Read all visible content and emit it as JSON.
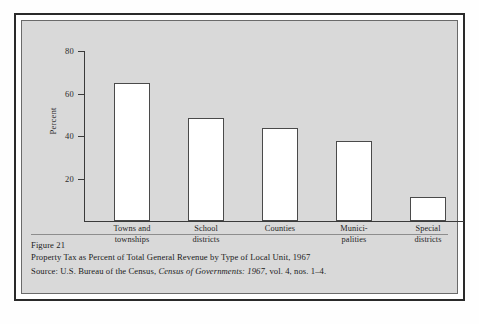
{
  "figure": {
    "number_label": "Figure 21",
    "title": "Property Tax as Percent of Total General Revenue by Type of Local Unit, 1967",
    "source_prefix": "Source:  U.S. Bureau of the Census, ",
    "source_italic": "Census of Governments:  1967",
    "source_suffix": ", vol. 4, nos. 1–4."
  },
  "chart_data": {
    "type": "bar",
    "title": "Property Tax as Percent of Total General Revenue by Type of Local Unit, 1967",
    "xlabel": "",
    "ylabel": "Percent",
    "ylim": [
      0,
      80
    ],
    "yticks": [
      20,
      40,
      60,
      80
    ],
    "ytick_labels": [
      "20",
      "40",
      "60",
      "80"
    ],
    "grid": false,
    "legend": false,
    "categories": [
      "Towns and townships",
      "School districts",
      "Counties",
      "Municipalities",
      "Special districts"
    ],
    "category_lines": [
      [
        "Towns and",
        "townships"
      ],
      [
        "School",
        "districts"
      ],
      [
        "Counties",
        ""
      ],
      [
        "Munici-",
        "palities"
      ],
      [
        "Special",
        "districts"
      ]
    ],
    "values": [
      65,
      48.5,
      44,
      37.5,
      11.5
    ],
    "bar_fill": "#ffffff",
    "bar_edge": "#4a4a4a"
  },
  "colors": {
    "panel": "#d9d9d9",
    "frame": "#2a2a2a",
    "axis": "#3a3a3a",
    "text": "#1b1b1b"
  }
}
